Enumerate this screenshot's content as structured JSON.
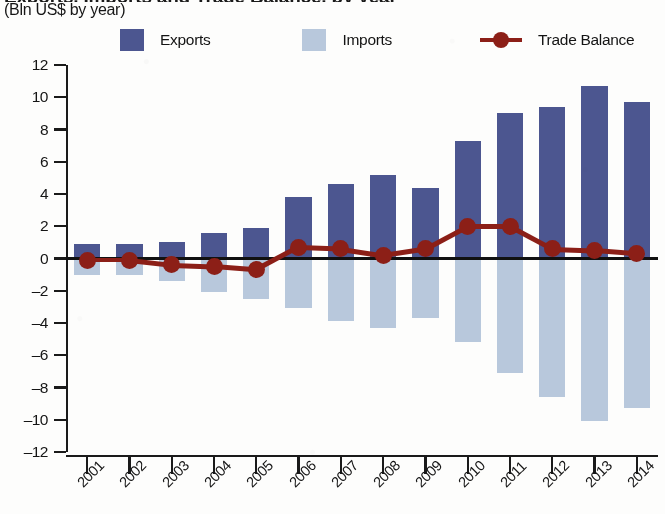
{
  "header": {
    "title_partial": "Exports, Imports and Trade Balance, by year",
    "subtitle": "(Bln US$ by year)"
  },
  "legend": {
    "items": [
      {
        "label": "Exports",
        "color": "#4c5690",
        "marker": "square"
      },
      {
        "label": "Imports",
        "color": "#b8c8dc",
        "marker": "square"
      },
      {
        "label": "Trade Balance",
        "color": "#8c1f17",
        "marker": "line-dot"
      }
    ]
  },
  "chart_data": {
    "type": "bar",
    "title": "Exports, Imports and Trade Balance, by year",
    "subtitle": "(Bln US$ by year)",
    "xlabel": "",
    "ylabel": "Bln US$",
    "ylim": [
      -12,
      12
    ],
    "ytick_step": 2,
    "ytick_labels": [
      "12",
      "10",
      "8",
      "6",
      "4",
      "2",
      "0",
      "–2",
      "–4",
      "–6",
      "–8",
      "–10",
      "–12"
    ],
    "grid": false,
    "legend_position": "top",
    "categories": [
      "2001",
      "2002",
      "2003",
      "2004",
      "2005",
      "2006",
      "2007",
      "2008",
      "2009",
      "2010",
      "2011",
      "2012",
      "2013",
      "2014"
    ],
    "series": [
      {
        "name": "Exports",
        "type": "bar",
        "color": "#4c5690",
        "values": [
          0.9,
          0.9,
          1.0,
          1.6,
          1.9,
          3.8,
          4.6,
          5.2,
          4.4,
          7.3,
          9.0,
          9.4,
          10.7,
          9.7
        ]
      },
      {
        "name": "Imports",
        "type": "bar",
        "color": "#b8c8dc",
        "values": [
          -1.0,
          -1.0,
          -1.4,
          -2.1,
          -2.5,
          -3.1,
          -3.9,
          -4.3,
          -3.7,
          -5.2,
          -7.1,
          -8.6,
          -10.1,
          -9.3
        ]
      },
      {
        "name": "Trade Balance",
        "type": "line",
        "color": "#8c1f17",
        "values": [
          -0.1,
          -0.1,
          -0.4,
          -0.5,
          -0.7,
          0.7,
          0.6,
          0.2,
          0.6,
          2.0,
          2.0,
          0.6,
          0.5,
          0.3
        ]
      }
    ]
  }
}
